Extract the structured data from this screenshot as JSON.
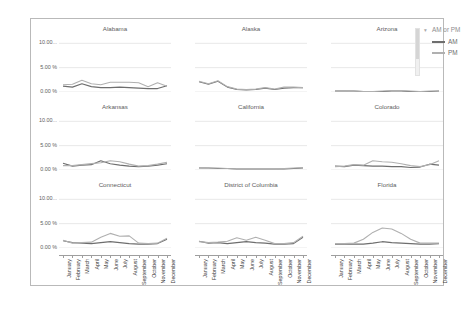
{
  "chart_title": "Weather Delay Pct by OriginStateName, MonthName, and AM or PM",
  "legend": {
    "title": "AM or PM",
    "caret": "▾",
    "items": [
      {
        "label": "AM",
        "color": "#6e6e6e"
      },
      {
        "label": "PM",
        "color": "#b0b0b0"
      }
    ]
  },
  "axis": {
    "y_ticks": [
      "10.00...",
      "5.00 %",
      "0.00 %"
    ],
    "y_values": [
      10,
      5,
      0
    ],
    "ylim": [
      0,
      11.5
    ],
    "x_categories": [
      "January",
      "February",
      "March",
      "April",
      "May",
      "June",
      "July",
      "August",
      "September",
      "October",
      "November",
      "December"
    ]
  },
  "chart_data": {
    "type": "line",
    "title": "Weather Delay Pct by OriginStateName, MonthName, and AM or PM",
    "xlabel": "",
    "ylabel": "Weather Delay Pct",
    "ylim": [
      0,
      11.5
    ],
    "grid": true,
    "legend_position": "right",
    "x": [
      "January",
      "February",
      "March",
      "April",
      "May",
      "June",
      "July",
      "August",
      "September",
      "October",
      "November",
      "December"
    ],
    "panels": [
      {
        "name": "Alabama",
        "row": 0,
        "col": 0,
        "series": [
          {
            "name": "AM",
            "values": [
              1.2,
              1.0,
              1.7,
              1.1,
              0.9,
              0.9,
              1.0,
              0.9,
              0.8,
              0.7,
              0.7,
              1.3
            ]
          },
          {
            "name": "PM",
            "values": [
              1.5,
              1.6,
              2.4,
              1.7,
              1.5,
              2.0,
              2.0,
              2.0,
              1.9,
              1.1,
              1.9,
              1.2
            ]
          }
        ]
      },
      {
        "name": "Alaska",
        "row": 0,
        "col": 1,
        "series": [
          {
            "name": "AM",
            "values": [
              2.1,
              1.6,
              2.2,
              1.0,
              0.5,
              0.4,
              0.5,
              0.8,
              0.5,
              0.8,
              0.9,
              0.9
            ]
          },
          {
            "name": "PM",
            "values": [
              2.2,
              1.7,
              2.3,
              1.1,
              0.6,
              0.5,
              0.6,
              0.9,
              0.6,
              1.0,
              1.0,
              0.9
            ]
          }
        ]
      },
      {
        "name": "Arizona",
        "row": 0,
        "col": 2,
        "series": [
          {
            "name": "AM",
            "values": [
              0.2,
              0.2,
              0.2,
              0.1,
              0.1,
              0.1,
              0.2,
              0.2,
              0.1,
              0.1,
              0.1,
              0.2
            ]
          },
          {
            "name": "PM",
            "values": [
              0.3,
              0.3,
              0.2,
              0.1,
              0.1,
              0.2,
              0.3,
              0.3,
              0.2,
              0.1,
              0.2,
              0.2
            ]
          }
        ]
      },
      {
        "name": "Arkansas",
        "row": 1,
        "col": 0,
        "series": [
          {
            "name": "AM",
            "values": [
              1.4,
              0.8,
              1.0,
              1.1,
              1.9,
              1.3,
              1.0,
              0.8,
              0.7,
              0.8,
              1.0,
              1.3
            ]
          },
          {
            "name": "PM",
            "values": [
              0.9,
              0.9,
              1.1,
              1.3,
              1.5,
              1.9,
              1.7,
              1.2,
              0.8,
              0.9,
              1.2,
              1.6
            ]
          }
        ]
      },
      {
        "name": "California",
        "row": 1,
        "col": 1,
        "series": [
          {
            "name": "AM",
            "values": [
              0.4,
              0.4,
              0.3,
              0.3,
              0.2,
              0.2,
              0.2,
              0.2,
              0.2,
              0.2,
              0.3,
              0.4
            ]
          },
          {
            "name": "PM",
            "values": [
              0.5,
              0.4,
              0.4,
              0.3,
              0.2,
              0.2,
              0.2,
              0.2,
              0.2,
              0.3,
              0.4,
              0.5
            ]
          }
        ]
      },
      {
        "name": "Colorado",
        "row": 1,
        "col": 2,
        "series": [
          {
            "name": "AM",
            "values": [
              0.8,
              0.7,
              1.0,
              0.9,
              0.8,
              0.8,
              0.7,
              0.7,
              0.5,
              0.6,
              1.2,
              1.0
            ]
          },
          {
            "name": "PM",
            "values": [
              0.7,
              0.8,
              1.1,
              1.0,
              1.9,
              1.7,
              1.6,
              1.3,
              0.9,
              0.7,
              1.1,
              1.9
            ]
          }
        ]
      },
      {
        "name": "Connecticut",
        "row": 2,
        "col": 0,
        "series": [
          {
            "name": "AM",
            "values": [
              1.5,
              1.1,
              1.0,
              0.9,
              1.1,
              1.3,
              1.1,
              0.9,
              0.8,
              0.8,
              0.9,
              1.8
            ]
          },
          {
            "name": "PM",
            "values": [
              1.6,
              1.0,
              1.1,
              1.2,
              2.2,
              3.0,
              2.4,
              2.5,
              1.0,
              0.9,
              1.0,
              2.0
            ]
          }
        ]
      },
      {
        "name": "District of Columbia",
        "row": 2,
        "col": 1,
        "series": [
          {
            "name": "AM",
            "values": [
              1.4,
              1.0,
              1.1,
              0.9,
              1.1,
              1.3,
              1.1,
              1.0,
              0.8,
              0.8,
              0.9,
              2.2
            ]
          },
          {
            "name": "PM",
            "values": [
              1.3,
              1.1,
              1.2,
              1.4,
              2.1,
              1.6,
              2.2,
              1.6,
              0.9,
              0.9,
              1.1,
              2.4
            ]
          }
        ]
      },
      {
        "name": "Florida",
        "row": 2,
        "col": 2,
        "series": [
          {
            "name": "AM",
            "values": [
              0.8,
              0.8,
              0.8,
              0.8,
              1.0,
              1.3,
              1.1,
              1.0,
              0.9,
              0.8,
              0.8,
              0.9
            ]
          },
          {
            "name": "PM",
            "values": [
              0.9,
              0.9,
              1.0,
              1.8,
              3.2,
              4.1,
              3.9,
              3.0,
              1.8,
              1.0,
              1.0,
              1.0
            ]
          }
        ]
      }
    ]
  }
}
